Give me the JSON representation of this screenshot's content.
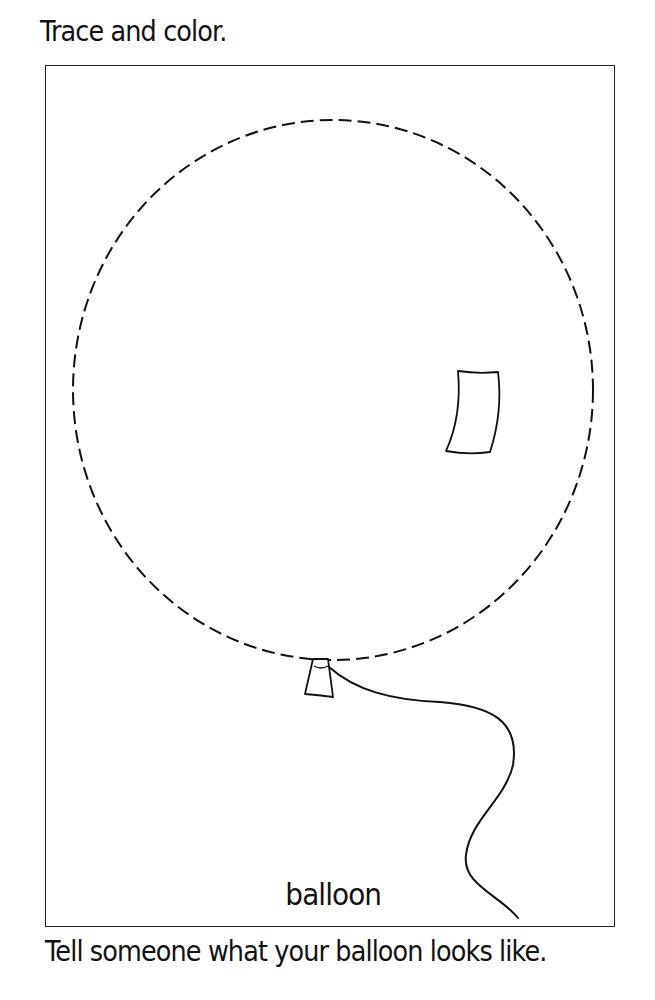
{
  "worksheet": {
    "instruction": "Trace and color.",
    "picture_label": "balloon",
    "prompt": "Tell someone what your balloon looks like."
  },
  "icons": {
    "balloon": "balloon-outline-dashed",
    "highlight": "balloon-highlight",
    "knot": "balloon-knot",
    "string": "balloon-string"
  },
  "colors": {
    "ink": "#111111",
    "paper": "#ffffff"
  }
}
